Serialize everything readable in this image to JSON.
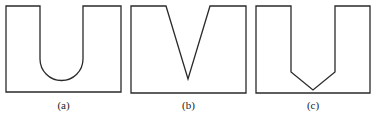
{
  "figure": {
    "panels": [
      {
        "id": "a",
        "label": "(a)",
        "notch_shape": "U-shaped rounded notch"
      },
      {
        "id": "b",
        "label": "(b)",
        "notch_shape": "V-shaped notch"
      },
      {
        "id": "c",
        "label": "(c)",
        "notch_shape": "flat-sided notch with V-shaped bottom"
      }
    ],
    "stroke_color": "#2a2a2a",
    "background": "#ffffff"
  }
}
